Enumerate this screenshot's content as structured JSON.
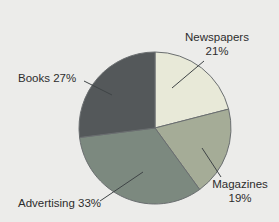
{
  "figure": {
    "background": "#ececea",
    "text_color": "#2d2d2d"
  },
  "chart_data": {
    "type": "pie",
    "title": "",
    "categories": [
      "Newspapers",
      "Magazines",
      "Advertising",
      "Books"
    ],
    "values": [
      21,
      19,
      33,
      27
    ],
    "unit": "%",
    "colors": [
      "#e8e9d8",
      "#a5ac97",
      "#7c897f",
      "#54585a"
    ],
    "stroke_color": "#6a6e70",
    "leader_line_color": "#3f4446",
    "start_angle_deg": 0,
    "direction": "clockwise",
    "legend": "none",
    "labels_style": "callouts-with-leader-lines",
    "callouts": {
      "newspapers": {
        "line1": "Newspapers",
        "line2": "21%"
      },
      "magazines": {
        "line1": "Magazines",
        "line2": "19%"
      },
      "advertising": {
        "line1": "Advertising 33%"
      },
      "books": {
        "line1": "Books 27%"
      }
    }
  }
}
